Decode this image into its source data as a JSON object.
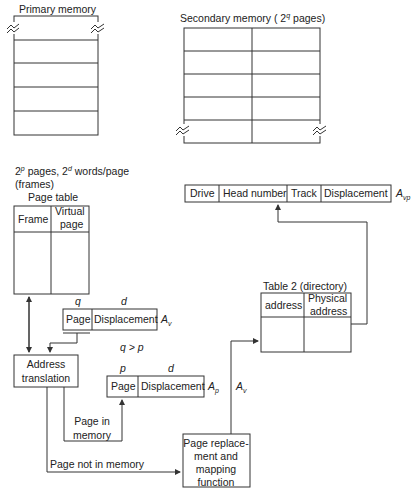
{
  "primary_memory": {
    "title": "Primary memory",
    "rows": 5
  },
  "secondary_memory": {
    "title_prefix": "Secondary memory ( 2",
    "title_sup": "q",
    "title_suffix": " pages)",
    "rows": 5,
    "cols": 2
  },
  "frames_note": {
    "line1_a": "2",
    "line1_sup_p": "p",
    "line1_b": " pages, 2",
    "line1_sup_d": "d",
    "line1_c": " words/page",
    "line2": "(frames)"
  },
  "page_table": {
    "title": "Page table",
    "col1": "Frame",
    "col2_l1": "Virtual",
    "col2_l2": "page"
  },
  "virtual_address": {
    "q_label": "q",
    "d_label": "d",
    "page": "Page",
    "displacement": "Displacement",
    "name": "A",
    "sub": "v"
  },
  "condition": "q > p",
  "physical_address": {
    "p_label": "p",
    "d_label": "d",
    "page": "Page",
    "displacement": "Displacement",
    "name": "A",
    "sub": "p"
  },
  "address_translation": {
    "l1": "Address",
    "l2": "translation"
  },
  "page_in_memory": {
    "l1": "Page in",
    "l2": "memory"
  },
  "page_not_in_memory": "Page not in memory",
  "page_replacement": {
    "l1": "Page replace-",
    "l2": "ment and",
    "l3": "mapping",
    "l4": "function"
  },
  "av_label": {
    "name": "A",
    "sub": "v"
  },
  "table2": {
    "title": "Table 2 (directory)",
    "col1": "address",
    "col2_l1": "Physical",
    "col2_l2": "address"
  },
  "disk_address": {
    "fields": [
      "Drive",
      "Head number",
      "Track",
      "Displacement"
    ],
    "name": "A",
    "sub": "vp"
  }
}
